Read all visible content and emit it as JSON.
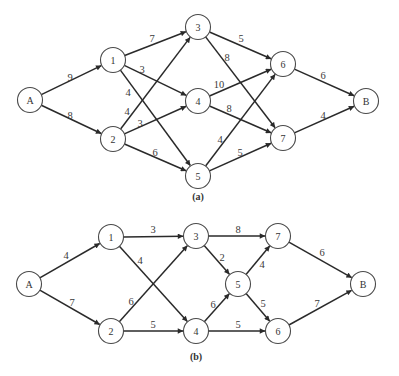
{
  "style": {
    "edge_color": "#2a2a2a",
    "node_stroke": "#4a4a4a",
    "node_radius": 12.5,
    "background": "#ffffff"
  },
  "diagrams": [
    {
      "id": "a",
      "caption": "(a)",
      "caption_pos": [
        198,
        196
      ],
      "nodes": [
        {
          "id": "A",
          "label": "A",
          "x": 30,
          "y": 100
        },
        {
          "id": "1",
          "label": "1",
          "x": 113,
          "y": 60
        },
        {
          "id": "2",
          "label": "2",
          "x": 113,
          "y": 139
        },
        {
          "id": "3",
          "label": "3",
          "x": 198,
          "y": 27
        },
        {
          "id": "4",
          "label": "4",
          "x": 198,
          "y": 101
        },
        {
          "id": "5",
          "label": "5",
          "x": 198,
          "y": 176
        },
        {
          "id": "6",
          "label": "6",
          "x": 283,
          "y": 64
        },
        {
          "id": "7",
          "label": "7",
          "x": 283,
          "y": 138
        },
        {
          "id": "B",
          "label": "B",
          "x": 366,
          "y": 101
        }
      ],
      "edges": [
        {
          "from": "A",
          "to": "1",
          "weight": "9",
          "label_pos": [
            70,
            77
          ]
        },
        {
          "from": "A",
          "to": "2",
          "weight": "8",
          "label_pos": [
            70,
            115
          ]
        },
        {
          "from": "1",
          "to": "3",
          "weight": "7",
          "label_pos": [
            152,
            38
          ]
        },
        {
          "from": "1",
          "to": "4",
          "weight": "3",
          "label_pos": [
            142,
            69
          ]
        },
        {
          "from": "1",
          "to": "5",
          "weight": "4",
          "label_pos": [
            128,
            92
          ]
        },
        {
          "from": "2",
          "to": "3",
          "weight": "4",
          "label_pos": [
            127,
            111
          ]
        },
        {
          "from": "2",
          "to": "4",
          "weight": "3",
          "label_pos": [
            140,
            123
          ]
        },
        {
          "from": "2",
          "to": "5",
          "weight": "6",
          "label_pos": [
            155,
            152
          ]
        },
        {
          "from": "3",
          "to": "6",
          "weight": "5",
          "label_pos": [
            241,
            38
          ]
        },
        {
          "from": "3",
          "to": "7",
          "weight": "8",
          "label_pos": [
            227,
            57
          ]
        },
        {
          "from": "4",
          "to": "6",
          "weight": "10",
          "label_pos": [
            219,
            84
          ]
        },
        {
          "from": "4",
          "to": "7",
          "weight": "8",
          "label_pos": [
            229,
            108
          ]
        },
        {
          "from": "5",
          "to": "6",
          "weight": "4",
          "label_pos": [
            220,
            139
          ]
        },
        {
          "from": "5",
          "to": "7",
          "weight": "5",
          "label_pos": [
            240,
            152
          ]
        },
        {
          "from": "6",
          "to": "B",
          "weight": "6",
          "label_pos": [
            323,
            75
          ]
        },
        {
          "from": "7",
          "to": "B",
          "weight": "4",
          "label_pos": [
            323,
            115
          ]
        }
      ]
    },
    {
      "id": "b",
      "caption": "(b)",
      "caption_pos": [
        196,
        356
      ],
      "nodes": [
        {
          "id": "A",
          "label": "A",
          "x": 29,
          "y": 284
        },
        {
          "id": "1",
          "label": "1",
          "x": 111,
          "y": 237
        },
        {
          "id": "2",
          "label": "2",
          "x": 111,
          "y": 331
        },
        {
          "id": "3",
          "label": "3",
          "x": 196,
          "y": 236
        },
        {
          "id": "4",
          "label": "4",
          "x": 196,
          "y": 331
        },
        {
          "id": "5",
          "label": "5",
          "x": 238,
          "y": 284
        },
        {
          "id": "6",
          "label": "6",
          "x": 278,
          "y": 331
        },
        {
          "id": "7",
          "label": "7",
          "x": 278,
          "y": 236
        },
        {
          "id": "B",
          "label": "B",
          "x": 363,
          "y": 284
        }
      ],
      "edges": [
        {
          "from": "A",
          "to": "1",
          "weight": "4",
          "label_pos": [
            66,
            255
          ]
        },
        {
          "from": "A",
          "to": "2",
          "weight": "7",
          "label_pos": [
            72,
            302
          ]
        },
        {
          "from": "1",
          "to": "3",
          "weight": "3",
          "label_pos": [
            153,
            229
          ]
        },
        {
          "from": "1",
          "to": "4",
          "weight": "4",
          "label_pos": [
            140,
            260
          ]
        },
        {
          "from": "2",
          "to": "3",
          "weight": "6",
          "label_pos": [
            131,
            301
          ]
        },
        {
          "from": "2",
          "to": "4",
          "weight": "5",
          "label_pos": [
            153,
            324
          ]
        },
        {
          "from": "3",
          "to": "7",
          "weight": "8",
          "label_pos": [
            238,
            229
          ]
        },
        {
          "from": "3",
          "to": "5",
          "weight": "2",
          "label_pos": [
            222,
            257
          ]
        },
        {
          "from": "4",
          "to": "5",
          "weight": "6",
          "label_pos": [
            213,
            304
          ]
        },
        {
          "from": "4",
          "to": "6",
          "weight": "5",
          "label_pos": [
            238,
            324
          ]
        },
        {
          "from": "5",
          "to": "7",
          "weight": "4",
          "label_pos": [
            262,
            264
          ]
        },
        {
          "from": "5",
          "to": "6",
          "weight": "5",
          "label_pos": [
            263,
            303
          ]
        },
        {
          "from": "7",
          "to": "B",
          "weight": "6",
          "label_pos": [
            322,
            252
          ]
        },
        {
          "from": "6",
          "to": "B",
          "weight": "7",
          "label_pos": [
            317,
            303
          ]
        }
      ]
    }
  ]
}
